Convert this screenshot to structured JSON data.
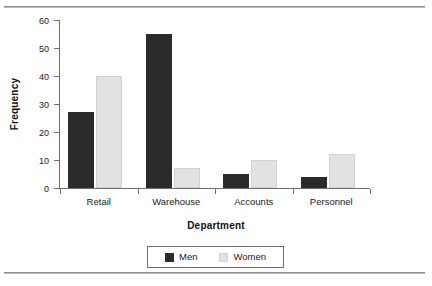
{
  "chart_data": {
    "type": "bar",
    "title": "",
    "xlabel": "Department",
    "ylabel": "Frequency",
    "categories": [
      "Retail",
      "Warehouse",
      "Accounts",
      "Personnel"
    ],
    "series": [
      {
        "name": "Men",
        "color": "#2b2b2b",
        "values": [
          27,
          55,
          5,
          4
        ]
      },
      {
        "name": "Women",
        "color": "#e2e2e2",
        "values": [
          40,
          7,
          10,
          12
        ]
      }
    ],
    "ylim": [
      0,
      60
    ],
    "ytick_labels": [
      "0",
      "10",
      "20",
      "30",
      "40",
      "50",
      "60"
    ],
    "ytick_values": [
      0,
      10,
      20,
      30,
      40,
      50,
      60
    ],
    "grid": false,
    "legend_position": "bottom-center",
    "axis_color": "#6e6e6e"
  }
}
